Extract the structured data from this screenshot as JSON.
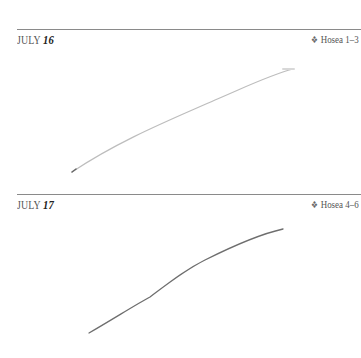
{
  "entries": [
    {
      "month": "JULY",
      "day": "16",
      "ornament": "❖",
      "reference": "Hosea 1–3",
      "handwriting": "faint pencil stroke"
    },
    {
      "month": "JULY",
      "day": "17",
      "ornament": "❖",
      "reference": "Hosea 4–6",
      "handwriting": "pencil stroke"
    }
  ],
  "colors": {
    "rule": "#8a8a8a",
    "text": "#555555",
    "ink_faint": "#b8b8b8",
    "ink_dark": "#6a6a6a"
  }
}
